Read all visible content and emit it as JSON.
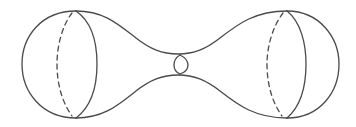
{
  "diagram": {
    "caption": "Two spheres connected by a narrow tube (dumbbell surface)",
    "stroke_color": "#4a4a4a",
    "background": "#ffffff",
    "parts": [
      {
        "name": "left-sphere",
        "meridian_solid": true,
        "meridian_dashed": true
      },
      {
        "name": "neck",
        "cross_section_ellipse": true
      },
      {
        "name": "right-sphere",
        "meridian_solid": true,
        "meridian_dashed": true
      }
    ]
  }
}
